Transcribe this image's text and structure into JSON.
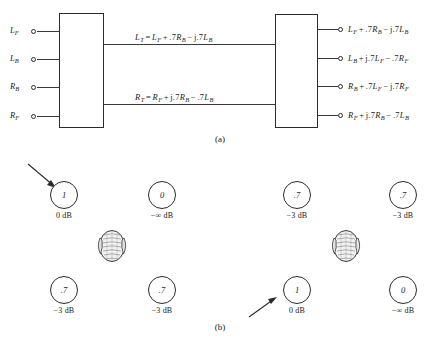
{
  "figure": {
    "panel_a": {
      "caption": "(a)",
      "inputs": [
        {
          "name": "L",
          "sub": "F"
        },
        {
          "name": "L",
          "sub": "B"
        },
        {
          "name": "R",
          "sub": "B"
        },
        {
          "name": "R",
          "sub": "F"
        }
      ],
      "transmission_equations": [
        {
          "lhs": "L",
          "lhs_sub": "T",
          "terms": [
            {
              "op": "",
              "coef": "",
              "var": "L",
              "sub": "F"
            },
            {
              "op": "+",
              "coef": ".7",
              "var": "R",
              "sub": "B"
            },
            {
              "op": "−",
              "coef": "j.7",
              "var": "L",
              "sub": "B"
            }
          ]
        },
        {
          "lhs": "R",
          "lhs_sub": "T",
          "terms": [
            {
              "op": "",
              "coef": "",
              "var": "R",
              "sub": "F"
            },
            {
              "op": "+",
              "coef": "j.7",
              "var": "R",
              "sub": "B"
            },
            {
              "op": "−",
              "coef": ".7",
              "var": "L",
              "sub": "B"
            }
          ]
        }
      ],
      "outputs": [
        {
          "terms": [
            {
              "op": "",
              "coef": "",
              "var": "L",
              "sub": "F"
            },
            {
              "op": "+",
              "coef": ".7",
              "var": "R",
              "sub": "B"
            },
            {
              "op": "−",
              "coef": "j.7",
              "var": "L",
              "sub": "B"
            }
          ]
        },
        {
          "terms": [
            {
              "op": "",
              "coef": "",
              "var": "L",
              "sub": "B"
            },
            {
              "op": "+",
              "coef": "j.7",
              "var": "L",
              "sub": "F"
            },
            {
              "op": "−",
              "coef": ".7",
              "var": "R",
              "sub": "F"
            }
          ]
        },
        {
          "terms": [
            {
              "op": "",
              "coef": "",
              "var": "R",
              "sub": "B"
            },
            {
              "op": "+",
              "coef": ".7",
              "var": "L",
              "sub": "F"
            },
            {
              "op": "−",
              "coef": "j.7",
              "var": "R",
              "sub": "F"
            }
          ]
        },
        {
          "terms": [
            {
              "op": "",
              "coef": "",
              "var": "R",
              "sub": "F"
            },
            {
              "op": "+",
              "coef": "j.7",
              "var": "R",
              "sub": "B"
            },
            {
              "op": "−",
              "coef": ".7",
              "var": "L",
              "sub": "B"
            }
          ]
        }
      ]
    },
    "panel_b": {
      "caption": "(b)",
      "groups": [
        {
          "name": "left-listening-position",
          "speakers": [
            {
              "position": "front-left",
              "gain": "1",
              "db": "0 dB",
              "arrow": true
            },
            {
              "position": "front-right",
              "gain": "0",
              "db": "−∞ dB",
              "arrow": false
            },
            {
              "position": "back-left",
              "gain": ".7",
              "db": "−3 dB",
              "arrow": false
            },
            {
              "position": "back-right",
              "gain": ".7",
              "db": "−3 dB",
              "arrow": false
            }
          ]
        },
        {
          "name": "right-listening-position",
          "speakers": [
            {
              "position": "front-left",
              "gain": ".7",
              "db": "−3 dB",
              "arrow": false
            },
            {
              "position": "front-right",
              "gain": ".7",
              "db": "−3 dB",
              "arrow": false
            },
            {
              "position": "back-left",
              "gain": "1",
              "db": "0 dB",
              "arrow": true
            },
            {
              "position": "back-right",
              "gain": "0",
              "db": "−∞ dB",
              "arrow": false
            }
          ]
        }
      ]
    }
  }
}
